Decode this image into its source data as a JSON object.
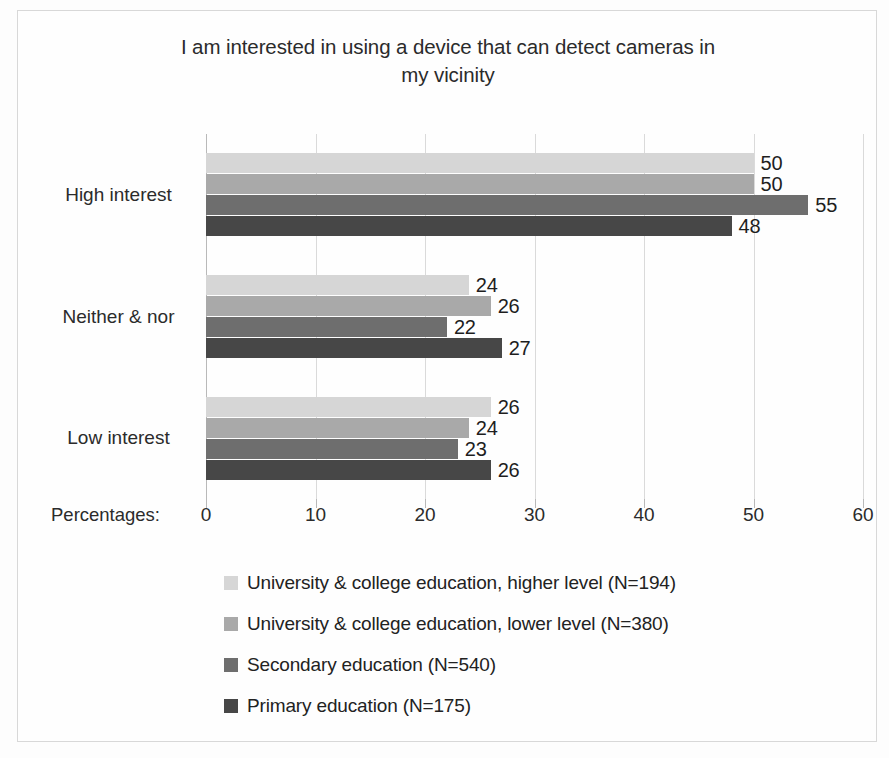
{
  "chart_data": {
    "type": "bar",
    "orientation": "horizontal",
    "grouped": true,
    "title": "I am interested in using a device that can detect cameras in my vicinity",
    "title_line1": "I am interested in using a device that can detect cameras in",
    "title_line2": "my vicinity",
    "xlabel": "Percentages:",
    "ylabel": "",
    "xlim": [
      0,
      60
    ],
    "xticks": [
      0,
      10,
      20,
      30,
      40,
      50,
      60
    ],
    "xtick_labels": [
      "0",
      "10",
      "20",
      "30",
      "40",
      "50",
      "60"
    ],
    "grid": true,
    "grid_axis": "x",
    "legend_position": "bottom",
    "categories": [
      "High interest",
      "Neither & nor",
      "Low interest"
    ],
    "series": [
      {
        "name": "University & college education, higher level  (N=194)",
        "color": "#d6d6d6",
        "values": [
          50,
          24,
          26
        ]
      },
      {
        "name": "University & college education, lower level  (N=380)",
        "color": "#a9a9a9",
        "values": [
          50,
          26,
          24
        ]
      },
      {
        "name": "Secondary education (N=540)",
        "color": "#6e6e6e",
        "values": [
          55,
          22,
          23
        ]
      },
      {
        "name": "Primary education (N=175)",
        "color": "#474747",
        "values": [
          48,
          27,
          26
        ]
      }
    ]
  },
  "legend": {
    "items": [
      {
        "label": "University & college education, higher level  (N=194)",
        "color": "#d6d6d6"
      },
      {
        "label": "University & college education, lower level  (N=380)",
        "color": "#a9a9a9"
      },
      {
        "label": "Secondary education (N=540)",
        "color": "#6e6e6e"
      },
      {
        "label": "Primary education (N=175)",
        "color": "#474747"
      }
    ]
  },
  "colors": {
    "background": "#fdfdfd",
    "frame": "#d8d8d8",
    "gridline": "#dadada",
    "axis": "#b9b9b9",
    "text": "#2b2b2b"
  }
}
